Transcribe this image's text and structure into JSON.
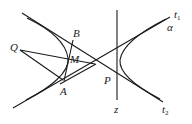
{
  "diagram": {
    "type": "geometry",
    "labels": {
      "Q": "Q",
      "B": "B",
      "M": "M",
      "A": "A",
      "P": "P",
      "z": "z",
      "t1_main": "t",
      "t1_sub": "1",
      "t2_main": "t",
      "t2_sub": "2",
      "alpha": "α"
    },
    "points": {
      "Q": [
        20,
        50
      ],
      "B": [
        75,
        38
      ],
      "M": [
        70,
        60
      ],
      "A": [
        63,
        84
      ],
      "P": [
        117,
        78
      ]
    }
  }
}
